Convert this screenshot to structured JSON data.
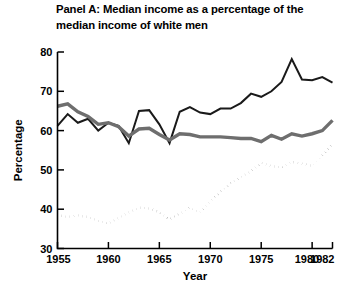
{
  "figure": {
    "title": "Panel A:  Median income as a percentage of the\nmedian income of white men",
    "background_color": "#ffffff"
  },
  "axis": {
    "ylabel": "Percentage",
    "xlabel": "Year",
    "y_ticks": [
      "30",
      "40",
      "50",
      "60",
      "70",
      "80"
    ],
    "x_ticks": [
      "1955",
      "1960",
      "1965",
      "1970",
      "1975",
      "1980",
      "1982"
    ]
  },
  "chart_data": {
    "type": "line",
    "title": "Panel A:  Median income as a percentage of the median income of white men",
    "xlabel": "Year",
    "ylabel": "Percentage",
    "xlim": [
      1955,
      1982
    ],
    "ylim": [
      30,
      80
    ],
    "grid": false,
    "legend": "none",
    "x": [
      1955,
      1956,
      1957,
      1958,
      1959,
      1960,
      1961,
      1962,
      1963,
      1964,
      1965,
      1966,
      1967,
      1968,
      1969,
      1970,
      1971,
      1972,
      1973,
      1974,
      1975,
      1976,
      1977,
      1978,
      1979,
      1980,
      1981,
      1982
    ],
    "series": [
      {
        "name": "black-line",
        "style": "solid",
        "color": "#1a1a1a",
        "width": 2.0,
        "values": [
          61.2,
          64.2,
          62.0,
          63.0,
          60.0,
          62.0,
          61.2,
          56.8,
          65.0,
          65.2,
          61.6,
          56.8,
          64.8,
          66.0,
          64.6,
          64.2,
          65.6,
          65.6,
          67.0,
          69.4,
          68.6,
          70.0,
          72.4,
          78.2,
          73.0,
          72.8,
          73.6,
          72.2
        ]
      },
      {
        "name": "gray-line",
        "style": "solid",
        "color": "#6e6e6e",
        "width": 3.4,
        "values": [
          66.2,
          66.8,
          64.8,
          63.6,
          61.6,
          62.0,
          61.0,
          58.6,
          60.4,
          60.6,
          59.0,
          57.6,
          59.2,
          59.0,
          58.4,
          58.4,
          58.4,
          58.2,
          58.0,
          58.0,
          57.2,
          58.8,
          57.8,
          59.2,
          58.6,
          59.2,
          60.0,
          62.6
        ]
      },
      {
        "name": "dotted-line",
        "style": "dotted",
        "color": "#1a1a1a",
        "width": 2.1,
        "values": [
          38.6,
          38.0,
          38.4,
          38.0,
          37.0,
          36.4,
          37.8,
          39.2,
          40.4,
          40.2,
          39.2,
          37.4,
          38.8,
          40.4,
          39.2,
          42.0,
          44.4,
          46.6,
          48.2,
          49.6,
          51.8,
          51.0,
          50.6,
          52.0,
          51.6,
          51.0,
          53.6,
          56.8
        ]
      }
    ]
  }
}
